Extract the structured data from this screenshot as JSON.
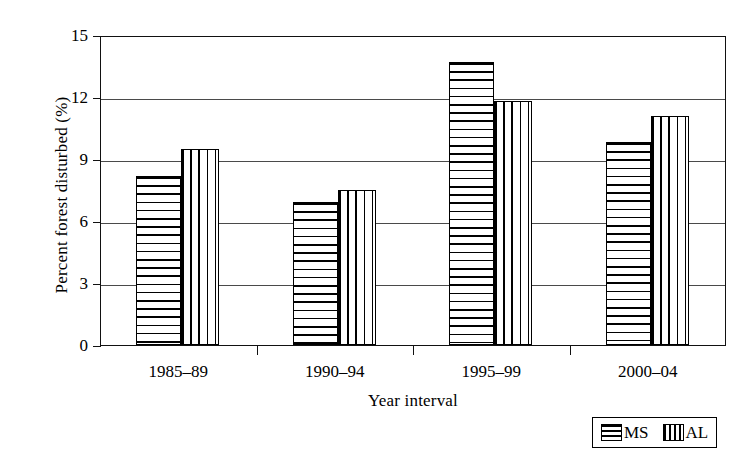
{
  "chart_data": {
    "type": "bar",
    "title": "",
    "xlabel": "Year interval",
    "ylabel": "Percent forest disturbed (%)",
    "categories": [
      "1985–89",
      "1990–94",
      "1995–99",
      "2000–04"
    ],
    "series": [
      {
        "name": "MS",
        "pattern": "horizontal-stripes",
        "values": [
          8.2,
          6.9,
          13.7,
          9.8
        ]
      },
      {
        "name": "AL",
        "pattern": "vertical-stripes",
        "values": [
          9.5,
          7.5,
          11.8,
          11.1
        ]
      }
    ],
    "ylim": [
      0,
      15
    ],
    "yticks": [
      0,
      3,
      6,
      9,
      12,
      15
    ],
    "ytick_labels": [
      "0",
      "3",
      "6",
      "9",
      "12",
      "15"
    ],
    "grid": "horizontal",
    "legend_position": "bottom-right",
    "colors": {
      "axis": "#111111",
      "grid": "#4a4a4a",
      "bar_outline": "#000000",
      "bar_fill": "#ffffff",
      "background": "#ffffff"
    }
  },
  "legend": {
    "entries": [
      {
        "label": "MS",
        "swatch": "horizontal-stripe-swatch"
      },
      {
        "label": "AL",
        "swatch": "vertical-stripe-swatch"
      }
    ]
  }
}
